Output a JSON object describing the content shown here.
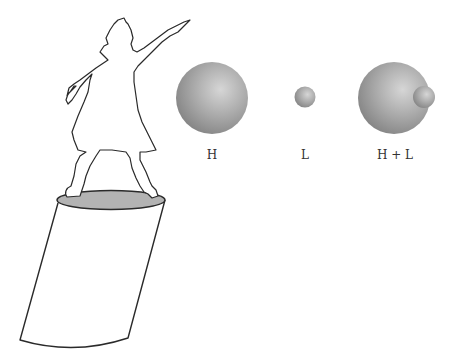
{
  "figure": {
    "labels": {
      "h": "H",
      "l": "L",
      "hl": "H + L"
    },
    "colors": {
      "outline": "#2a2a2a",
      "pedestal_top": "#b3b3b3",
      "sphere_light": "#d8d8d8",
      "sphere_mid": "#a6a6a6",
      "sphere_dark": "#7a7a7a",
      "background": "#ffffff"
    }
  }
}
